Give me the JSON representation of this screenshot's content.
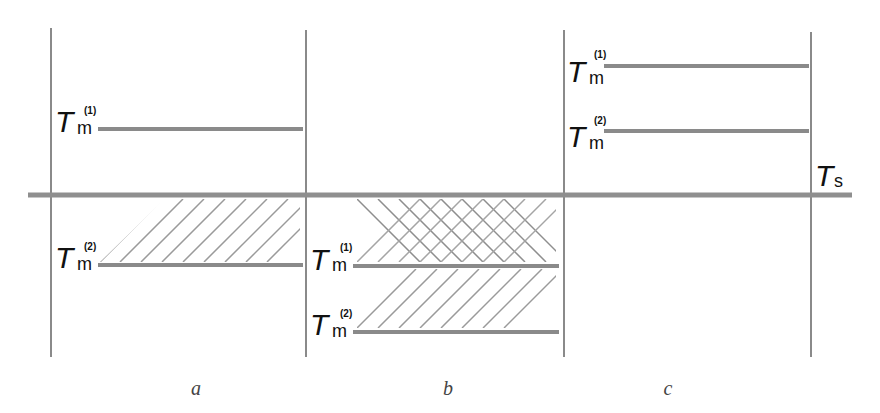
{
  "diagram": {
    "colors": {
      "line": "#8a8a8a",
      "heavy_line": "#8f8f8f",
      "hatch": "#9a9a9a",
      "text": "#111111",
      "caption": "#444444"
    },
    "reference_line": {
      "label_main": "T",
      "label_sub": "s",
      "y": 195
    },
    "panels": [
      {
        "caption": "a",
        "levels": [
          {
            "main": "T",
            "sub": "m",
            "sup": "(1)",
            "position": "above",
            "y": 128
          },
          {
            "main": "T",
            "sub": "m",
            "sup": "(2)",
            "position": "below",
            "y": 265
          }
        ],
        "hatch": "single-diagonal between Ts and Tm(2)"
      },
      {
        "caption": "b",
        "levels": [
          {
            "main": "T",
            "sub": "m",
            "sup": "(1)",
            "position": "below",
            "y": 265
          },
          {
            "main": "T",
            "sub": "m",
            "sup": "(2)",
            "position": "below",
            "y": 331
          }
        ],
        "hatch": "cross-hatch between Ts and Tm(1); single-diagonal between Tm(1) and Tm(2)"
      },
      {
        "caption": "c",
        "levels": [
          {
            "main": "T",
            "sub": "m",
            "sup": "(1)",
            "position": "above",
            "y": 65
          },
          {
            "main": "T",
            "sub": "m",
            "sup": "(2)",
            "position": "above",
            "y": 130
          }
        ],
        "hatch": "none"
      }
    ]
  }
}
